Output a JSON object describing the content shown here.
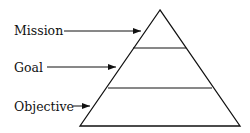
{
  "diagram": {
    "type": "pyramid",
    "levels": [
      {
        "label": "Mission"
      },
      {
        "label": "Goal"
      },
      {
        "label": "Objective"
      }
    ],
    "colors": {
      "stroke": "#111111",
      "background": "#ffffff"
    }
  }
}
